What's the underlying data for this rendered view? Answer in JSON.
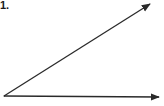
{
  "problem": {
    "number_label": "1."
  },
  "diagram": {
    "type": "angle",
    "stroke_color": "#2a2a2a",
    "vertex": [
      4,
      96
    ],
    "rays": [
      {
        "name": "upper-ray",
        "end": [
          152,
          3
        ]
      },
      {
        "name": "lower-ray",
        "end": [
          161,
          97
        ]
      }
    ]
  }
}
